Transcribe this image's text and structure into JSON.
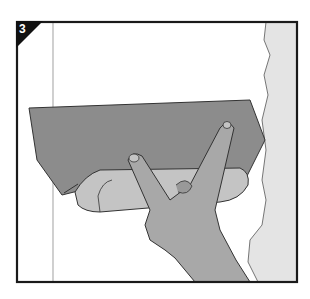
{
  "figure": {
    "step_number": "3",
    "colors": {
      "frame": "#1a1a1a",
      "blade": "#8c8c8c",
      "handle": "#c4c4c4",
      "hand": "#a8a8a8",
      "wall_edge": "#e4e4e4",
      "background": "#ffffff",
      "guide_line": "#b0b0b0"
    }
  }
}
